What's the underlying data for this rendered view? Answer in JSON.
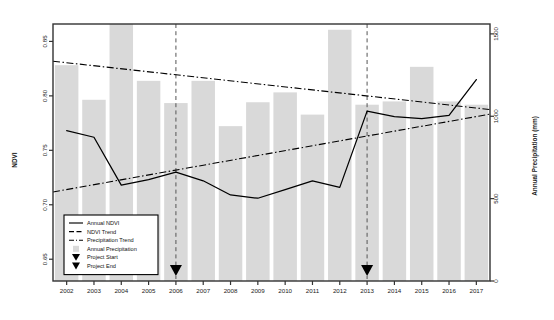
{
  "chart_data": {
    "type": "bar",
    "title": "",
    "xlabel": "",
    "ylabel": "NDVI",
    "y2label": "Annual Precipitation (mm)",
    "categories": [
      "2002",
      "2003",
      "2004",
      "2005",
      "2006",
      "2007",
      "2008",
      "2009",
      "2010",
      "2011",
      "2012",
      "2013",
      "2014",
      "2015",
      "2016",
      "2017"
    ],
    "x": [
      2002,
      2003,
      2004,
      2005,
      2006,
      2007,
      2008,
      2009,
      2010,
      2011,
      2012,
      2013,
      2014,
      2015,
      2016,
      2017
    ],
    "ylim": [
      0.63,
      0.866
    ],
    "y2lim": [
      0,
      1560
    ],
    "yticks": [
      "0.65",
      "0.70",
      "0.75",
      "0.80",
      "0.85"
    ],
    "ytick_values": [
      0.65,
      0.7,
      0.75,
      0.8,
      0.85
    ],
    "y2ticks": [
      "0",
      "500",
      "1000",
      "1500"
    ],
    "y2tick_values": [
      0,
      500,
      1000,
      1500
    ],
    "grid": false,
    "legend_position": "bottom-left",
    "series": [
      {
        "name": "Annual Precipitation",
        "type": "bar",
        "axis": "right",
        "color": "#d9d9d9",
        "values": [
          1310,
          1100,
          1560,
          1215,
          1080,
          1215,
          940,
          1085,
          1145,
          1010,
          1525,
          1070,
          1090,
          1300,
          1090,
          1070
        ]
      },
      {
        "name": "Annual NDVI",
        "type": "line",
        "axis": "left",
        "color": "#000000",
        "values": [
          0.768,
          0.762,
          0.718,
          0.723,
          0.73,
          0.722,
          0.709,
          0.706,
          0.714,
          0.722,
          0.716,
          0.786,
          0.781,
          0.779,
          0.782,
          0.815
        ]
      },
      {
        "name": "NDVI Trend",
        "type": "line",
        "axis": "left",
        "color": "#000000",
        "style": "dashdot",
        "endpoints": [
          [
            2002,
            0.714
          ],
          [
            2017,
            0.781
          ]
        ]
      },
      {
        "name": "Precipitation Trend",
        "type": "line",
        "axis": "right",
        "color": "#000000",
        "style": "dashdot",
        "endpoints": [
          [
            2002,
            1325
          ],
          [
            2017,
            1050
          ]
        ]
      }
    ],
    "annotations": [
      {
        "name": "Project Start",
        "type": "vline-marker",
        "x": 2006,
        "marker": "triangle-down"
      },
      {
        "name": "Project End",
        "type": "vline-marker",
        "x": 2013,
        "marker": "triangle-down"
      }
    ],
    "legend": [
      {
        "label": "Annual NDVI",
        "symbol": "solid-line"
      },
      {
        "label": "NDVI Trend",
        "symbol": "dashed-line"
      },
      {
        "label": "Precipitation Trend",
        "symbol": "dashdot-line"
      },
      {
        "label": "Annual Precipitation",
        "symbol": "gray-square"
      },
      {
        "label": "Project Start",
        "symbol": "triangle-down"
      },
      {
        "label": "Project End",
        "symbol": "triangle-down"
      }
    ]
  },
  "axes": {
    "left_title": "NDVI",
    "right_title": "Annual Precipitation (mm)"
  }
}
